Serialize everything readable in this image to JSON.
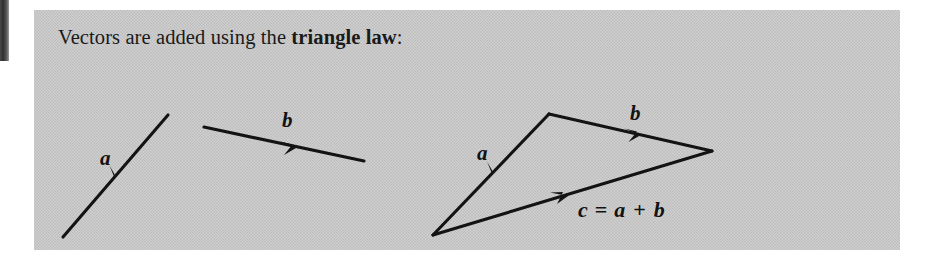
{
  "figure": {
    "caption_prefix": "Vectors are added using the ",
    "caption_bold": "triangle law",
    "caption_suffix": ":",
    "panel_color": "#c9c9c9",
    "ink_color": "#131313",
    "page_background": "#ffffff",
    "edge_marker_color": "#2f2f2f"
  },
  "diagrams": [
    {
      "name": "vector-a-standalone",
      "label": "a",
      "label_x": 66,
      "label_y": 155,
      "start": {
        "x": 29,
        "y": 227
      },
      "end": {
        "x": 134,
        "y": 105
      },
      "arrow_t": 0.5
    },
    {
      "name": "vector-b-standalone",
      "label": "b",
      "label_x": 248,
      "label_y": 117,
      "start": {
        "x": 170,
        "y": 117
      },
      "end": {
        "x": 330,
        "y": 151
      },
      "arrow_t": 0.5
    }
  ],
  "triangle": {
    "name": "triangle-law-sum",
    "vertices": {
      "tail": {
        "x": 399,
        "y": 225
      },
      "apex": {
        "x": 515,
        "y": 104
      },
      "head": {
        "x": 678,
        "y": 141
      }
    },
    "edges": [
      {
        "name": "edge-a",
        "label": "a",
        "label_x": 443,
        "label_y": 150,
        "arrow_t": 0.52
      },
      {
        "name": "edge-b",
        "label": "b",
        "label_x": 596,
        "label_y": 110,
        "arrow_t": 0.53
      },
      {
        "name": "edge-c",
        "label": "c = a + b",
        "arrow_t": 0.46
      }
    ],
    "sum_label": {
      "c": "c",
      "equals": "=",
      "a": "a",
      "plus": "+",
      "b": "b",
      "x": 544,
      "y": 207
    }
  }
}
